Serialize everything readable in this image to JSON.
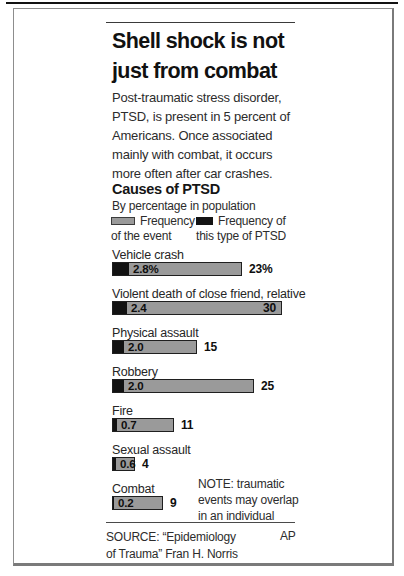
{
  "header": {
    "title_lines": [
      "Shell shock is not",
      "just from combat"
    ],
    "intro_lines": [
      "Post-traumatic stress disorder,",
      "PTSD, is present in 5 percent of",
      "Americans. Once associated",
      "mainly with combat, it occurs",
      "more often after car crashes."
    ]
  },
  "chart": {
    "heading": "Causes of PTSD",
    "subheading": "By percentage in population",
    "legend": [
      {
        "swatch": "gray",
        "color": "#9a9a9a",
        "lines": [
          "Frequency",
          "of the event"
        ]
      },
      {
        "swatch": "black",
        "color": "#141414",
        "lines": [
          "Frequency of",
          "this type of PTSD"
        ]
      }
    ]
  },
  "chart_data": {
    "type": "bar",
    "orientation": "horizontal",
    "title": "Causes of PTSD",
    "subtitle": "By percentage in population",
    "unit": "percent of population",
    "grid": false,
    "legend_position": "above",
    "categories": [
      "Vehicle crash",
      "Violent death of close friend, relative",
      "Physical assault",
      "Robbery",
      "Fire",
      "Sexual assault",
      "Combat"
    ],
    "series": [
      {
        "name": "Frequency of the event",
        "color": "#9a9a9a",
        "values": [
          23,
          30,
          15,
          25,
          11,
          4,
          9
        ]
      },
      {
        "name": "Frequency of this type of PTSD",
        "color": "#141414",
        "values": [
          2.8,
          2.4,
          2.0,
          2.0,
          0.7,
          0.6,
          0.2
        ]
      }
    ],
    "px_per_percent": 5.66,
    "rows": [
      {
        "label": "Vehicle crash",
        "ptsd_value": 2.8,
        "ptsd_text": "2.8%",
        "event_value": 23,
        "event_text": "23%",
        "event_text_pos": "outside"
      },
      {
        "label": "Violent death of close friend, relative",
        "ptsd_value": 2.4,
        "ptsd_text": "2.4",
        "event_value": 30,
        "event_text": "30",
        "event_text_pos": "inside"
      },
      {
        "label": "Physical assault",
        "ptsd_value": 2.0,
        "ptsd_text": "2.0",
        "event_value": 15,
        "event_text": "15",
        "event_text_pos": "outside"
      },
      {
        "label": "Robbery",
        "ptsd_value": 2.0,
        "ptsd_text": "2.0",
        "event_value": 25,
        "event_text": "25",
        "event_text_pos": "outside"
      },
      {
        "label": "Fire",
        "ptsd_value": 0.7,
        "ptsd_text": "0.7",
        "event_value": 11,
        "event_text": "11",
        "event_text_pos": "outside"
      },
      {
        "label": "Sexual assault",
        "ptsd_value": 0.6,
        "ptsd_text": "0.6",
        "event_value": 4,
        "event_text": "4",
        "event_text_pos": "outside"
      },
      {
        "label": "Combat",
        "ptsd_value": 0.2,
        "ptsd_text": "0.2",
        "event_value": 9,
        "event_text": "9",
        "event_text_pos": "outside"
      }
    ]
  },
  "note": {
    "lines": [
      "NOTE: traumatic",
      "events may overlap",
      "in an individual"
    ]
  },
  "footer": {
    "source_lines": [
      "SOURCE: “Epidemiology",
      "of Trauma” Fran H. Norris"
    ],
    "credit": "AP"
  }
}
